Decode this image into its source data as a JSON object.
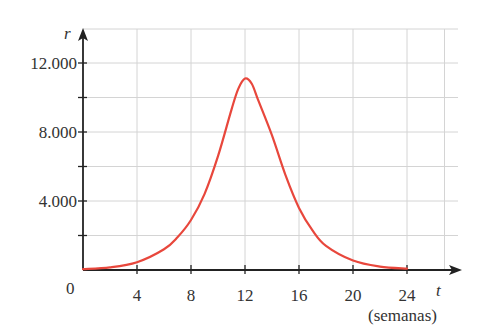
{
  "chart_data": {
    "type": "line",
    "title": "",
    "xlabel": "t",
    "xlabel_unit": "(semanas)",
    "ylabel": "r",
    "origin_label": "0",
    "x_ticks": [
      4,
      8,
      12,
      16,
      20,
      24
    ],
    "x_tick_labels": [
      "4",
      "8",
      "12",
      "16",
      "20",
      "24"
    ],
    "y_ticks": [
      4000,
      8000,
      12000
    ],
    "y_tick_labels": [
      "4.000",
      "8.000",
      "12.000"
    ],
    "y_minor_ticks": [
      2000,
      6000,
      10000
    ],
    "xlim": [
      0,
      27
    ],
    "ylim": [
      0,
      14000
    ],
    "grid": true,
    "legend": null,
    "series": [
      {
        "name": "r(t)",
        "color": "#e8473c",
        "x": [
          0,
          2,
          4,
          6,
          7,
          8,
          9,
          10,
          11,
          11.5,
          12,
          12.5,
          13,
          14,
          15,
          16,
          17,
          18,
          20,
          22,
          24
        ],
        "values": [
          50,
          150,
          450,
          1200,
          1900,
          2900,
          4400,
          6600,
          9300,
          10500,
          11100,
          10800,
          9800,
          7800,
          5500,
          3600,
          2300,
          1400,
          550,
          200,
          80
        ]
      }
    ]
  }
}
